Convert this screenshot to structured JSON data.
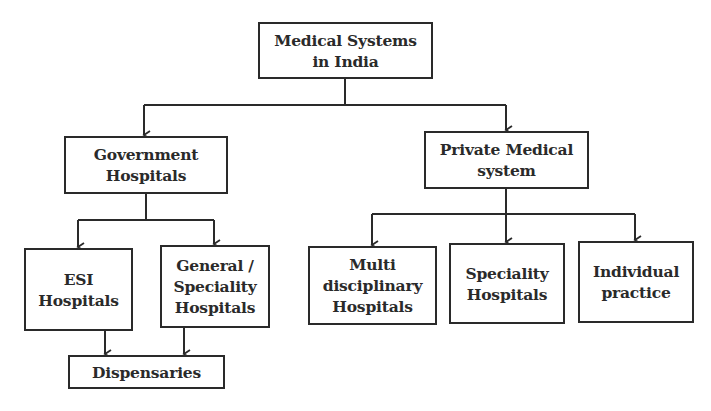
{
  "diagram": {
    "type": "hierarchy",
    "root": {
      "label": "Medical Systems\nin India"
    },
    "nodes": {
      "government": {
        "label": "Government\nHospitals"
      },
      "private": {
        "label": "Private Medical\nsystem"
      },
      "esi": {
        "label": "ESI\nHospitals"
      },
      "general": {
        "label": "General /\nSpeciality\nHospitals"
      },
      "dispensaries": {
        "label": "Dispensaries"
      },
      "multi": {
        "label": "Multi\ndisciplinary\nHospitals"
      },
      "speciality": {
        "label": "Speciality\nHospitals"
      },
      "individual": {
        "label": "Individual\npractice"
      }
    },
    "edges": [
      [
        "Medical Systems in India",
        "Government Hospitals"
      ],
      [
        "Medical Systems in India",
        "Private Medical system"
      ],
      [
        "Government Hospitals",
        "ESI Hospitals"
      ],
      [
        "Government Hospitals",
        "General / Speciality Hospitals"
      ],
      [
        "ESI Hospitals",
        "Dispensaries"
      ],
      [
        "General / Speciality Hospitals",
        "Dispensaries"
      ],
      [
        "Private Medical system",
        "Multi disciplinary Hospitals"
      ],
      [
        "Private Medical system",
        "Speciality Hospitals"
      ],
      [
        "Private Medical system",
        "Individual practice"
      ]
    ],
    "colors": {
      "line": "#2a2a2a",
      "background": "#ffffff"
    }
  }
}
